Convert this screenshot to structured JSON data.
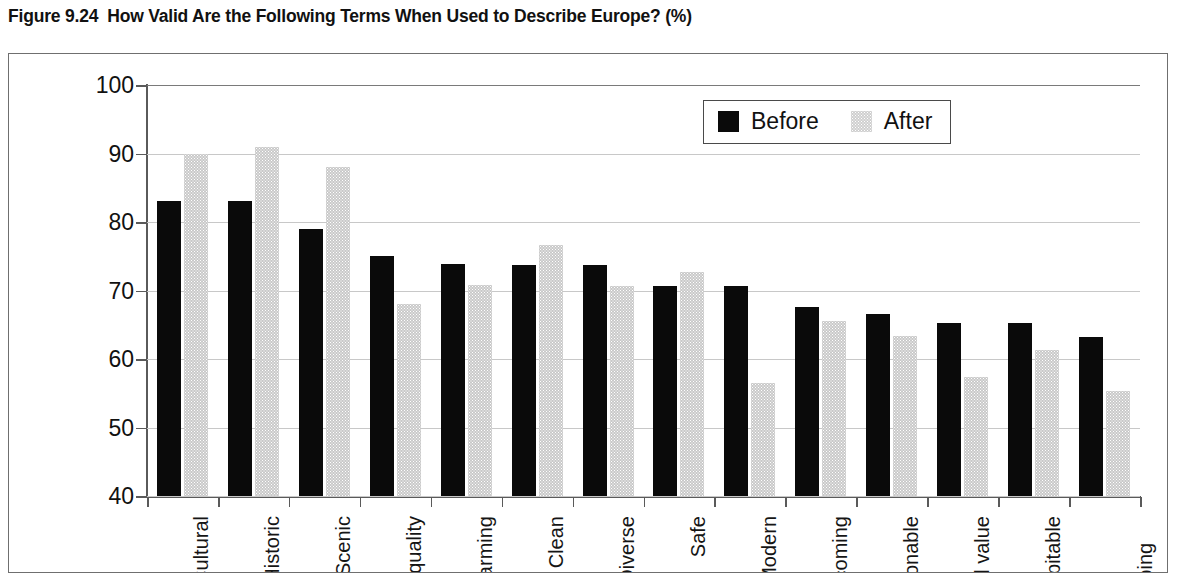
{
  "title": {
    "figure_number": "Figure 9.24",
    "text": "How Valid Are the Following Terms When Used to Describe Europe? (%)"
  },
  "legend": {
    "position": "top-right",
    "items": [
      {
        "label": "Before",
        "color": "#0a0a0a"
      },
      {
        "label": "After",
        "color": "#c9c9c9"
      }
    ]
  },
  "chart_data": {
    "type": "bar",
    "title": "How Valid Are the Following Terms When Used to Describe Europe? (%)",
    "xlabel": "",
    "ylabel": "",
    "ylim": [
      40,
      100
    ],
    "yticks": [
      40,
      50,
      60,
      70,
      80,
      90,
      100
    ],
    "ytick_labels": [
      "40",
      "50",
      "60",
      "70",
      "80",
      "90",
      "100"
    ],
    "grid": true,
    "grid_axis": "y",
    "legend_position": "top-right",
    "categories": [
      "Cultural",
      "Historic",
      "Scenic",
      "High quality",
      "Charming",
      "Clean",
      "Diverse",
      "Safe",
      "Modern",
      "Welcoming",
      "Fashionable",
      "Good value",
      "Hospitable",
      "Good shopping"
    ],
    "series": [
      {
        "name": "Before",
        "color": "#0a0a0a",
        "values": [
          83,
          83,
          79,
          75,
          73.8,
          73.7,
          73.7,
          70.7,
          70.7,
          67.6,
          66.5,
          65.3,
          65.3,
          63.2
        ]
      },
      {
        "name": "After",
        "color": "#c9c9c9",
        "values": [
          90,
          91,
          88,
          68,
          70.8,
          76.6,
          70.7,
          72.7,
          56.5,
          65.5,
          63.4,
          57.4,
          61.3,
          55.3
        ]
      }
    ]
  }
}
